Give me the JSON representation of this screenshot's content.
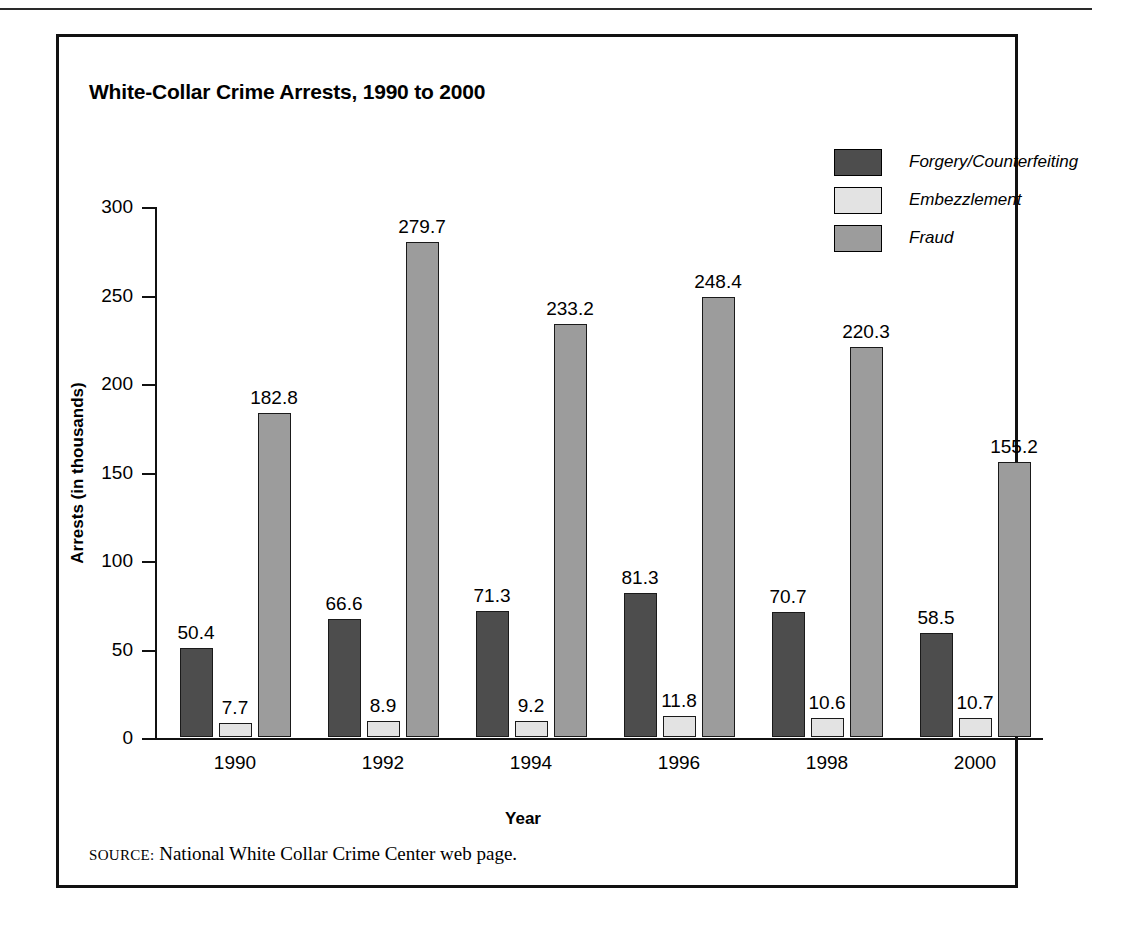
{
  "figure": {
    "title": "White-Collar Crime Arrests, 1990 to 2000",
    "source_label": "SOURCE:",
    "source_text": "National White Collar Crime Center web page."
  },
  "colors": {
    "forgery": "#4d4d4d",
    "embezzlement": "#e3e3e3",
    "fraud": "#9c9c9c",
    "outline": "#1a1a1a",
    "axis": "#111111",
    "background": "#ffffff"
  },
  "chart_data": {
    "type": "bar",
    "title": "White-Collar Crime Arrests, 1990 to 2000",
    "xlabel": "Year",
    "ylabel": "Arrests (in thousands)",
    "ylim": [
      0,
      300
    ],
    "yticks": [
      0,
      50,
      100,
      150,
      200,
      250,
      300
    ],
    "ytick_labels": [
      "0",
      "50",
      "100",
      "150",
      "200",
      "250",
      "300"
    ],
    "grid": false,
    "legend_position": "top-right",
    "categories": [
      "1990",
      "1992",
      "1994",
      "1996",
      "1998",
      "2000"
    ],
    "series": [
      {
        "name": "Forgery/Counterfeiting",
        "color": "#4d4d4d",
        "values": [
          50.4,
          66.6,
          71.3,
          81.3,
          70.7,
          58.5
        ],
        "labels": [
          "50.4",
          "66.6",
          "71.3",
          "81.3",
          "70.7",
          "58.5"
        ]
      },
      {
        "name": "Embezzlement",
        "color": "#e3e3e3",
        "values": [
          7.7,
          8.9,
          9.2,
          11.8,
          10.6,
          10.7
        ],
        "labels": [
          "7.7",
          "8.9",
          "9.2",
          "11.8",
          "10.6",
          "10.7"
        ]
      },
      {
        "name": "Fraud",
        "color": "#9c9c9c",
        "values": [
          182.8,
          279.7,
          233.2,
          248.4,
          220.3,
          155.2
        ],
        "labels": [
          "182.8",
          "279.7",
          "233.2",
          "248.4",
          "220.3",
          "155.2"
        ]
      }
    ]
  }
}
